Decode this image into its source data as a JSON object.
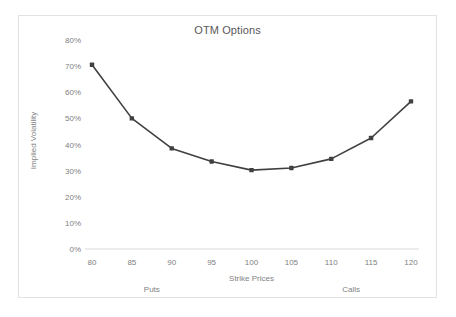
{
  "chart_data": {
    "type": "line",
    "title": "OTM Options",
    "xlabel": "Strike Prices",
    "ylabel": "Implied Volatility",
    "categories": [
      80,
      85,
      90,
      95,
      100,
      105,
      110,
      115,
      120
    ],
    "x": [
      80,
      85,
      90,
      95,
      100,
      105,
      110,
      115,
      120
    ],
    "values": [
      70.5,
      50.0,
      38.5,
      33.5,
      30.2,
      31.0,
      34.5,
      42.5,
      56.5
    ],
    "series": [
      {
        "name": "Implied Volatility",
        "values": [
          70.5,
          50.0,
          38.5,
          33.5,
          30.2,
          31.0,
          34.5,
          42.5,
          56.5
        ]
      }
    ],
    "ylim": [
      0,
      80
    ],
    "xlim": [
      80,
      120
    ],
    "y_tick_labels": [
      "0%",
      "10%",
      "20%",
      "30%",
      "40%",
      "50%",
      "60%",
      "70%",
      "80%"
    ],
    "y_tick_values": [
      0,
      10,
      20,
      30,
      40,
      50,
      60,
      70,
      80
    ],
    "x_tick_labels": [
      "80",
      "85",
      "90",
      "95",
      "100",
      "105",
      "110",
      "115",
      "120"
    ],
    "grid": false,
    "legend": "none",
    "annotations": [
      {
        "text": "Puts",
        "x": 87.5
      },
      {
        "text": "Calls",
        "x": 112.5
      }
    ],
    "line_color": "#404040",
    "marker_color": "#404040",
    "axis_text_color": "#7f7f7f",
    "title_color": "#595959",
    "plot_background": "#ffffff",
    "border_color": "#e2e2e2"
  }
}
